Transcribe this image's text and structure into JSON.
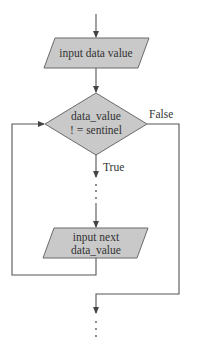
{
  "diagram": {
    "type": "flowchart",
    "colors": {
      "shape_fill": "#c9c9c9",
      "stroke": "#6a6a6a",
      "text": "#333333"
    },
    "nodes": [
      {
        "id": "input1",
        "kind": "input-output",
        "lines": [
          "input data  value"
        ]
      },
      {
        "id": "decision",
        "kind": "decision",
        "lines": [
          "data_value",
          "! = sentinel"
        ]
      },
      {
        "id": "input2",
        "kind": "input-output",
        "lines": [
          "input next",
          "data_value"
        ]
      }
    ],
    "edges": [
      {
        "from": "start",
        "to": "input1",
        "label": ""
      },
      {
        "from": "input1",
        "to": "decision",
        "label": ""
      },
      {
        "from": "decision",
        "to": "input2",
        "label": "True",
        "continuation": true
      },
      {
        "from": "input2",
        "to": "decision",
        "label": "",
        "loop_back": true
      },
      {
        "from": "decision",
        "to": "end",
        "label": "False",
        "continuation": true
      }
    ],
    "labels": {
      "true": "True",
      "false": "False"
    }
  }
}
